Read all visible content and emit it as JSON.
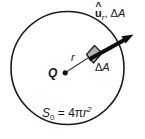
{
  "figure": {
    "kind": "gauss-law-spherical-surface-diagram",
    "background_color": "#ffffff",
    "stroke_color": "#1a1a1a",
    "patch_fill_color": "#b3b3b3"
  },
  "labels": {
    "charge": "Q",
    "radius": "r",
    "normal_vector_symbol": "u",
    "normal_vector_hat": "^",
    "normal_vector_subscript": "r",
    "normal_separator": ", ",
    "area_delta": "Δ",
    "area_symbol": "A",
    "patch_label_delta": "Δ",
    "patch_label_symbol": "A",
    "surface_symbol": "S",
    "surface_subscript": "0",
    "surface_equals": " = 4",
    "surface_pi": "π",
    "surface_radius": "r",
    "surface_exponent": "2"
  },
  "geometry": {
    "circle_center_x": 67.5,
    "circle_center_y": 68,
    "circle_radius": 56.5,
    "charge_dot_x": 65,
    "charge_dot_y": 73,
    "patch_center_x": 93,
    "patch_center_y": 57,
    "arrow_tip_x": 133,
    "arrow_tip_y": 34,
    "arrow_tail_x": 90,
    "arrow_tail_y": 59
  }
}
